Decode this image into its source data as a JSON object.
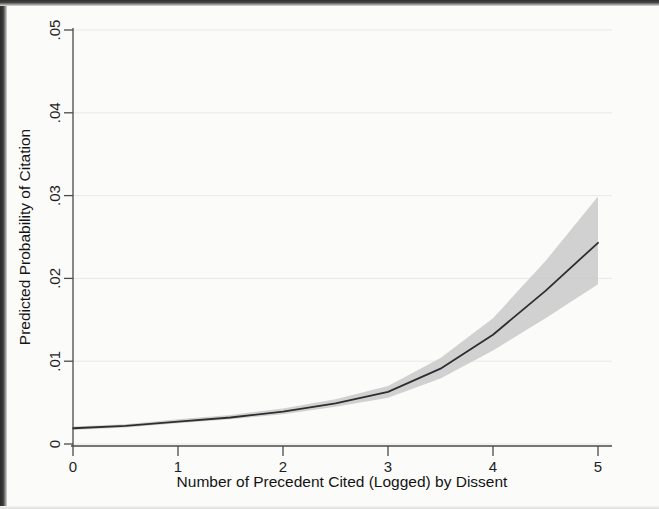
{
  "chart_data": {
    "type": "line",
    "title": "",
    "subtitle": "",
    "xlabel": "Number of Precedent Cited (Logged) by Dissent",
    "ylabel": "Predicted Probability of Citation",
    "xlim": [
      0,
      5
    ],
    "ylim": [
      0,
      0.05
    ],
    "xticks": [
      0,
      1,
      2,
      3,
      4,
      5
    ],
    "xticklabels": [
      "0",
      "1",
      "2",
      "3",
      "4",
      "5"
    ],
    "yticks": [
      0,
      0.01,
      0.02,
      0.03,
      0.04,
      0.05
    ],
    "yticklabels": [
      "0",
      ".01",
      ".02",
      ".03",
      ".04",
      ".05"
    ],
    "grid": "horizontal-faint",
    "legend": "none",
    "x": [
      0,
      0.5,
      1,
      1.5,
      2,
      2.5,
      3,
      3.5,
      4,
      4.5,
      5
    ],
    "series": [
      {
        "name": "Predicted probability",
        "values": [
          0.0019,
          0.0022,
          0.0027,
          0.0032,
          0.0039,
          0.0049,
          0.0063,
          0.0091,
          0.0132,
          0.0185,
          0.0243
        ]
      }
    ],
    "confidence_band": {
      "name": "95% confidence interval",
      "color": "#c9c9c9",
      "lower": [
        0.0017,
        0.002,
        0.0025,
        0.003,
        0.0036,
        0.0045,
        0.0056,
        0.0079,
        0.0113,
        0.0152,
        0.0193
      ],
      "upper": [
        0.0021,
        0.0024,
        0.003,
        0.0035,
        0.0043,
        0.0054,
        0.007,
        0.0104,
        0.0152,
        0.0221,
        0.0299
      ]
    },
    "line_color": "#2e2e2e",
    "background_color": "#fbfbfa"
  },
  "axis": {
    "x_title": "Number of Precedent Cited (Logged) by Dissent",
    "y_title": "Predicted Probability of Citation"
  }
}
